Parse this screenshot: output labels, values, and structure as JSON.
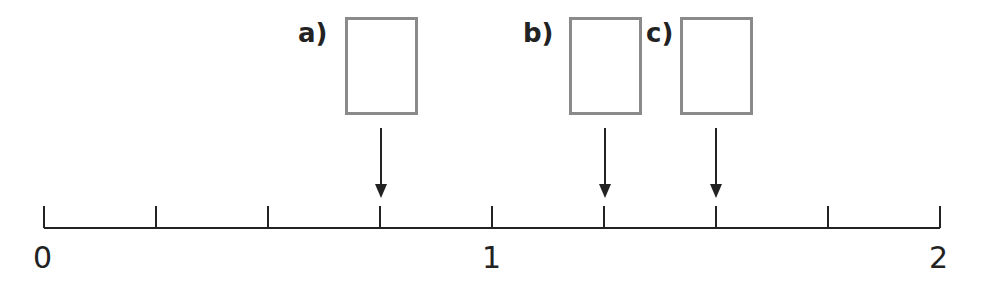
{
  "diagram": {
    "type": "number-line",
    "range": [
      0,
      2
    ],
    "tick_step": 0.25,
    "tick_labels": [
      {
        "value": 0,
        "text": "0"
      },
      {
        "value": 1,
        "text": "1"
      },
      {
        "value": 2,
        "text": "2"
      }
    ],
    "answer_boxes": [
      {
        "label": "a)",
        "points_to": 0.75,
        "value": ""
      },
      {
        "label": "b)",
        "points_to": 1.25,
        "value": ""
      },
      {
        "label": "c)",
        "points_to": 1.5,
        "value": ""
      }
    ],
    "colors": {
      "line": "#222222",
      "box_border": "#8a8a8a"
    }
  }
}
